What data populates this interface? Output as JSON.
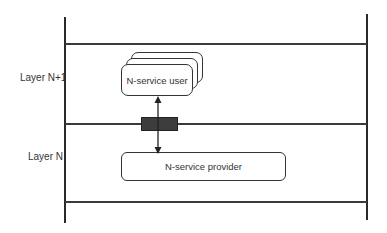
{
  "diagram": {
    "layers": [
      {
        "label": "Layer N+1"
      },
      {
        "label": "Layer N"
      }
    ],
    "entities": {
      "user": {
        "label": "N-service user",
        "stacked": 3
      },
      "provider": {
        "label": "N-service provider"
      }
    },
    "connector": {
      "type": "bidirectional-arrow",
      "from": "N-service user",
      "to": "N-service provider",
      "through": "service access point"
    },
    "colors": {
      "line": "#2a2a2a",
      "sap_fill": "#3d3d3d",
      "background": "#ffffff"
    }
  }
}
